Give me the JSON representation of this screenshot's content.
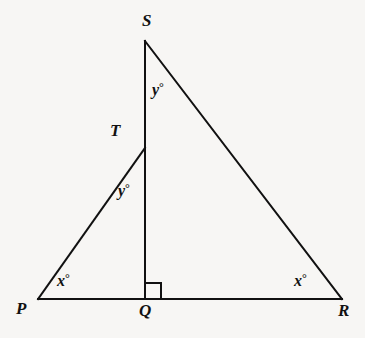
{
  "figure": {
    "type": "geometry-diagram",
    "background_color": "#f7f6f4",
    "line_color": "#111111",
    "line_width": 2,
    "vertices": [
      {
        "id": "S",
        "label": "S",
        "x": 145,
        "y": 41,
        "label_x": 142,
        "label_y": 12
      },
      {
        "id": "T",
        "label": "T",
        "x": 145,
        "y": 148,
        "label_x": 110,
        "label_y": 122
      },
      {
        "id": "P",
        "label": "P",
        "x": 38,
        "y": 299,
        "label_x": 16,
        "label_y": 300
      },
      {
        "id": "Q",
        "label": "Q",
        "x": 145,
        "y": 299,
        "label_x": 139,
        "label_y": 302
      },
      {
        "id": "R",
        "label": "R",
        "x": 342,
        "y": 299,
        "label_x": 338,
        "label_y": 302
      }
    ],
    "segments": [
      {
        "id": "PR",
        "from": "P",
        "to": "R",
        "name": "base-line-PR"
      },
      {
        "id": "SQ",
        "from": "S",
        "to": "Q",
        "name": "altitude-line-SQ"
      },
      {
        "id": "SR",
        "from": "S",
        "to": "R",
        "name": "hypotenuse-line-SR"
      },
      {
        "id": "PT",
        "from": "P",
        "to": "T",
        "name": "hypotenuse-line-PT"
      }
    ],
    "right_angle_marker": {
      "name": "right-angle-marker-at-Q",
      "vertex": "Q",
      "size": 16,
      "path": "M 145 283 L 161 283 L 161 299"
    },
    "angle_labels": [
      {
        "id": "y-top",
        "text": "y",
        "degree": "°",
        "at_vertex": "S",
        "x": 152,
        "y": 81,
        "value": "y°"
      },
      {
        "id": "y-mid",
        "text": "y",
        "degree": "°",
        "at_vertex": "T",
        "x": 118,
        "y": 182,
        "value": "y°"
      },
      {
        "id": "x-left",
        "text": "x",
        "degree": "°",
        "at_vertex": "P",
        "x": 57,
        "y": 272,
        "value": "x°"
      },
      {
        "id": "x-right",
        "text": "x",
        "degree": "°",
        "at_vertex": "R",
        "x": 294,
        "y": 272,
        "value": "x°"
      }
    ]
  }
}
